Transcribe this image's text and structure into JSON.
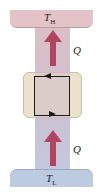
{
  "diagram": {
    "type": "heat-flow",
    "top_reservoir": {
      "label": "T",
      "subscript": "H",
      "color": "#e4c3c8"
    },
    "bottom_reservoir": {
      "label": "T",
      "subscript": "L",
      "color": "#bccbe0"
    },
    "engine_box": {
      "color": "#ece2cc",
      "loop_direction": "counterclockwise"
    },
    "arrows": [
      {
        "position": "upper",
        "label": "Q",
        "direction": "up",
        "color": "#b0455f"
      },
      {
        "position": "lower",
        "label": "Q",
        "direction": "up",
        "color": "#b0455f"
      }
    ]
  }
}
